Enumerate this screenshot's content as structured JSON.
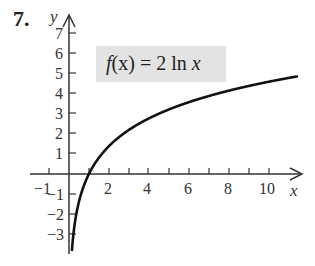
{
  "problem_number": "7.",
  "function_label": {
    "prefix": "f",
    "arg": "(x)",
    "rhs": " = 2 ln ",
    "var": "x"
  },
  "chart_data": {
    "type": "line",
    "title": "f(x) = 2 ln x",
    "xlabel": "x",
    "ylabel": "y",
    "xlim": [
      -1.5,
      11.5
    ],
    "ylim": [
      -4,
      7.6
    ],
    "x_ticks": [
      -1,
      1,
      2,
      3,
      4,
      5,
      6,
      7,
      8,
      9,
      10
    ],
    "x_tick_labels": [
      "-1",
      "2",
      "4",
      "6",
      "8",
      "10"
    ],
    "y_ticks": [
      -3,
      -2,
      -1,
      1,
      2,
      3,
      4,
      5,
      6,
      7
    ],
    "y_tick_labels": [
      "-3",
      "-2",
      "-1",
      "1",
      "2",
      "3",
      "4",
      "5",
      "6",
      "7"
    ],
    "grid": false,
    "series": [
      {
        "name": "f(x) = 2 ln x",
        "x": [
          0.15,
          0.2,
          0.3,
          0.5,
          0.75,
          1,
          1.5,
          2,
          3,
          4,
          5,
          6,
          7,
          8,
          9,
          10,
          11.4
        ],
        "values": [
          -3.79,
          -3.22,
          -2.41,
          -1.39,
          -0.58,
          0,
          0.81,
          1.39,
          2.2,
          2.77,
          3.22,
          3.58,
          3.89,
          4.16,
          4.39,
          4.61,
          4.87
        ]
      }
    ]
  },
  "labels": {
    "y_axis": "y",
    "x_axis": "x",
    "xt_m1": "−1",
    "xt_2": "2",
    "xt_4": "4",
    "xt_6": "6",
    "xt_8": "8",
    "xt_10": "10",
    "yt_7": "7",
    "yt_6": "6",
    "yt_5": "5",
    "yt_4": "4",
    "yt_3": "3",
    "yt_2": "2",
    "yt_1": "1",
    "yt_m1": "−1",
    "yt_m2": "−2",
    "yt_m3": "−3"
  }
}
